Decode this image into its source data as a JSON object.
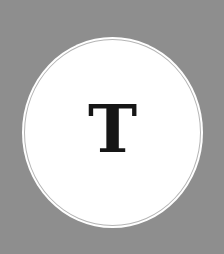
{
  "avatar": {
    "initial": "T",
    "background_color": "#8e8e8e",
    "circle_color": "#ffffff",
    "ring_color": "#b5b5b5",
    "text_color": "#161616"
  }
}
